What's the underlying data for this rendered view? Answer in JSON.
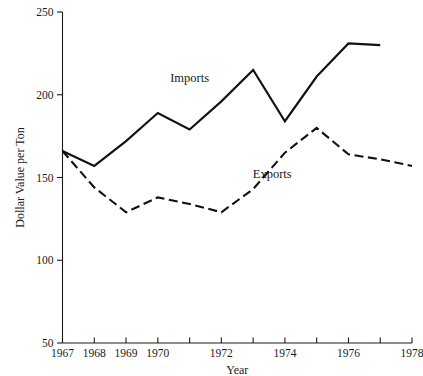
{
  "chart_data": {
    "type": "line",
    "title": "",
    "xlabel": "Year",
    "ylabel": "Dollar Value per Ton",
    "xlim": [
      1967,
      1978
    ],
    "ylim": [
      50,
      250
    ],
    "grid": false,
    "legend_position": "inline-annotation",
    "x_tick_labels": [
      "1967",
      "1968",
      "1969",
      "1970",
      "",
      "1972",
      "",
      "1974",
      "",
      "1976",
      "",
      "1978"
    ],
    "x_ticks": [
      1967,
      1968,
      1969,
      1970,
      1971,
      1972,
      1973,
      1974,
      1975,
      1976,
      1977,
      1978
    ],
    "y_ticks": [
      50,
      100,
      150,
      200,
      250
    ],
    "y_tick_labels": [
      "50",
      "100",
      "150",
      "200",
      "250"
    ],
    "series": [
      {
        "name": "Imports",
        "style": "solid",
        "color": "#111111",
        "x": [
          1967,
          1968,
          1969,
          1970,
          1971,
          1972,
          1973,
          1974,
          1975,
          1976,
          1977
        ],
        "values": [
          166,
          157,
          172,
          189,
          179,
          196,
          215,
          184,
          211,
          231,
          230
        ]
      },
      {
        "name": "Exports",
        "style": "dashed",
        "color": "#111111",
        "x": [
          1967,
          1968,
          1969,
          1970,
          1971,
          1972,
          1973,
          1974,
          1975,
          1976,
          1977,
          1978
        ],
        "values": [
          166,
          144,
          129,
          138,
          134,
          129,
          143,
          165,
          180,
          164,
          161,
          157
        ]
      }
    ],
    "annotations": [
      {
        "text": "Imports",
        "x": 1971.0,
        "y": 208
      },
      {
        "text": "Exports",
        "x": 1973.6,
        "y": 150
      }
    ]
  }
}
